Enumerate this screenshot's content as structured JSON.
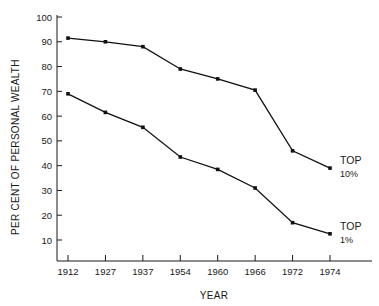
{
  "chart_data": {
    "type": "line",
    "title": "",
    "xlabel": "YEAR",
    "ylabel": "PER CENT OF PERSONAL WEALTH",
    "categories": [
      "1912",
      "1927",
      "1937",
      "1954",
      "1960",
      "1966",
      "1972",
      "1974"
    ],
    "x_tick_labels": [
      "1912",
      "1927",
      "1937",
      "1954",
      "1960",
      "1966",
      "1972",
      "1974"
    ],
    "y_tick_labels": [
      "100",
      "90",
      "80",
      "70",
      "60",
      "50",
      "40",
      "30",
      "20",
      "10"
    ],
    "y_ticks": [
      100,
      90,
      80,
      70,
      60,
      50,
      40,
      30,
      20,
      10
    ],
    "ylim": [
      5,
      100
    ],
    "grid": false,
    "legend_position": "right-inline",
    "line_color": "#111111",
    "marker_color": "#111111",
    "series": [
      {
        "name": "TOP 10%",
        "label_line1": "TOP",
        "label_line2": "10%",
        "values": [
          91.5,
          90,
          88,
          79,
          75,
          70.5,
          46,
          39
        ]
      },
      {
        "name": "TOP 1%",
        "label_line1": "TOP",
        "label_line2": "1%",
        "values": [
          69,
          61.5,
          55.5,
          43.5,
          38.5,
          31,
          17,
          12.5
        ]
      }
    ]
  }
}
